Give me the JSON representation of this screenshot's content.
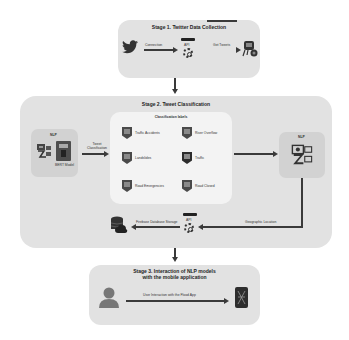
{
  "stage1": {
    "title": "Stage 1. Twitter Data Collection",
    "connection_label": "Connection",
    "api_label": "API",
    "get_tweets_label": "Get Tweets",
    "icons": [
      "twitter-bird-icon",
      "api-gear-icon",
      "tweet-data-icon"
    ]
  },
  "stage2": {
    "title": "Stage 2. Tweet Classification",
    "nlp_left": {
      "title": "NLP",
      "model_label": "BERT Model",
      "icons": [
        "nlp-robot-icon",
        "bert-model-icon"
      ]
    },
    "tweet_classification_label": "Tweet Classification",
    "classification": {
      "title": "Classification labels",
      "labels": [
        {
          "name": "Traffic Accidents",
          "icon": "car-accident-icon"
        },
        {
          "name": "River Overflow",
          "icon": "river-icon"
        },
        {
          "name": "Landslides",
          "icon": "landslide-icon"
        },
        {
          "name": "Traffic",
          "icon": "traffic-light-icon"
        },
        {
          "name": "Road Emergencies",
          "icon": "emergency-siren-icon"
        },
        {
          "name": "Road Closed",
          "icon": "road-closed-icon"
        }
      ]
    },
    "nlp_right": {
      "title": "NLP",
      "icons": [
        "nlp-robot-icon"
      ]
    },
    "geographic_location_label": "Geographic Location",
    "api_label": "API",
    "firebase_label": "Firebase Database Storage",
    "icons": [
      "database-cloud-icon",
      "api-gear-icon"
    ]
  },
  "stage3": {
    "title_line1": "Stage 3. Interaction of NLP models",
    "title_line2": "with the mobile application",
    "interaction_label": "User Interaction with the Flood App",
    "icons": [
      "user-icon",
      "mobile-app-icon"
    ]
  },
  "colors": {
    "stage_bg": "#e2e2e2",
    "nlp_bg": "#d2d2d2",
    "class_bg": "#f3f3f3",
    "arrow": "#3a3a3a"
  }
}
